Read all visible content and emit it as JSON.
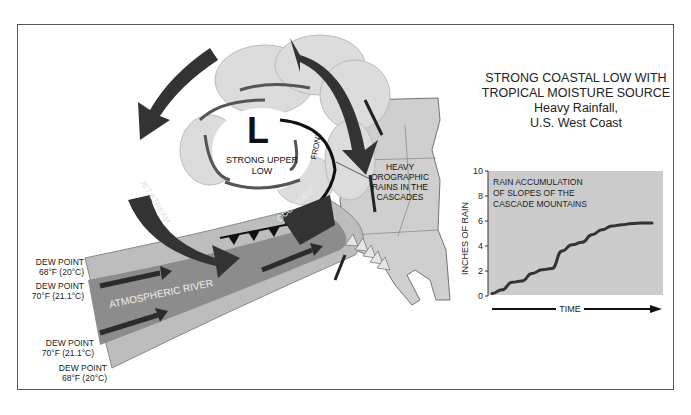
{
  "title": {
    "line1": "STRONG COASTAL LOW WITH",
    "line2": "TROPICAL MOISTURE SOURCE",
    "line3": "Heavy Rainfall,",
    "line4": "U.S.  West Coast"
  },
  "labels": {
    "low_symbol": "L",
    "strong_upper_low_1": "STRONG UPPER",
    "strong_upper_low_2": "LOW",
    "jet_stream": "JET STREAM",
    "occluded": "OCCLUDED",
    "front": "FRONT",
    "atmospheric_river": "ATMOSPHERIC RIVER",
    "orographic_1": "HEAVY",
    "orographic_2": "OROGRAPHIC",
    "orographic_3": "RAINS IN THE",
    "orographic_4": "CASCADES"
  },
  "dew_points": [
    {
      "label": "DEW POINT",
      "value": "68°F (20°C)"
    },
    {
      "label": "DEW POINT",
      "value": "70°F (21.1°C)"
    },
    {
      "label": "DEW POINT",
      "value": "70°F (21.1°C)"
    },
    {
      "label": "DEW POINT",
      "value": "68°F (20°C)"
    }
  ],
  "inset_chart": {
    "annotation_1": "RAIN ACCUMULATION",
    "annotation_2": "OF SLOPES OF THE",
    "annotation_3": "CASCADE MOUNTAINS",
    "ylabel": "INCHES OF RAIN",
    "xlabel": "TIME",
    "yticks": [
      "0",
      "2",
      "4",
      "6",
      "8",
      "10"
    ]
  },
  "colors": {
    "river_outer": "#bdbdbd",
    "river_inner": "#8c8c8c",
    "arrow_dark": "#2b2b2b",
    "cloud": "#dcdcdc",
    "land": "#cfcfcf",
    "chart_bg": "#cccccc"
  },
  "chart_data": {
    "type": "line",
    "title": "RAIN ACCUMULATION OF SLOPES OF THE CASCADE MOUNTAINS",
    "xlabel": "TIME",
    "ylabel": "INCHES OF RAIN",
    "ylim": [
      0,
      10
    ],
    "yticks": [
      0,
      2,
      4,
      6,
      8,
      10
    ],
    "grid": false,
    "x": [
      0,
      1,
      2,
      3,
      4,
      5,
      6,
      7,
      8,
      9,
      10,
      11,
      12,
      13,
      14,
      15,
      16
    ],
    "series": [
      {
        "name": "Rain accumulation",
        "values": [
          0.2,
          0.5,
          1.1,
          1.2,
          1.8,
          2.1,
          2.2,
          3.6,
          4.1,
          4.3,
          4.9,
          5.3,
          5.6,
          5.7,
          5.8,
          5.85,
          5.85
        ]
      }
    ]
  }
}
